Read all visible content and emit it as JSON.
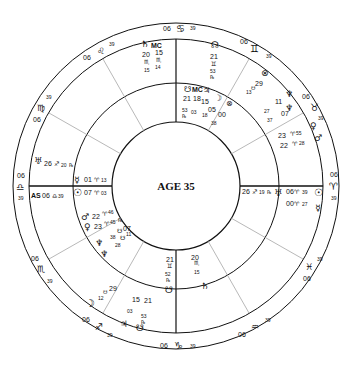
{
  "center_label": "AGE 35",
  "signs": [
    {
      "glyph": "♋",
      "deg": "06",
      "min": "39",
      "name": "cancer"
    },
    {
      "glyph": "♊",
      "deg": "06",
      "min": "39",
      "name": "gemini"
    },
    {
      "glyph": "♉",
      "deg": "06",
      "min": "39",
      "name": "taurus"
    },
    {
      "glyph": "♈",
      "deg": "06",
      "min": "39",
      "name": "aries"
    },
    {
      "glyph": "♓",
      "deg": "06",
      "min": "39",
      "name": "pisces"
    },
    {
      "glyph": "♒",
      "deg": "06",
      "min": "39",
      "name": "aquarius"
    },
    {
      "glyph": "♑",
      "deg": "06",
      "min": "39",
      "name": "capricorn"
    },
    {
      "glyph": "♐",
      "deg": "06",
      "min": "39",
      "name": "sagittarius"
    },
    {
      "glyph": "♏",
      "deg": "06",
      "min": "39",
      "name": "scorpio"
    },
    {
      "glyph": "♎",
      "deg": "06",
      "min": "39",
      "name": "libra"
    },
    {
      "glyph": "♍",
      "deg": "06",
      "min": "39",
      "name": "virgo"
    },
    {
      "glyph": "♌",
      "deg": "06",
      "min": "39",
      "name": "leo"
    }
  ],
  "outer_planets": {
    "saturn_mc": {
      "g1": "♄",
      "g2": "MC",
      "d1": "20",
      "s1": "♏",
      "m1": "15",
      "d2": "15",
      "s2": "♏",
      "m2": "14"
    },
    "node_top": {
      "g": "☊",
      "d": "21",
      "s": "♊",
      "m": "53",
      "r": "℞"
    },
    "node_bottom": {
      "g": "☋",
      "d": "21",
      "s": "♊",
      "m": "52",
      "r": "℞"
    },
    "saturn_bottom": {
      "g": "♄",
      "d": "20",
      "s": "♏",
      "m": "15"
    },
    "uranus_left": {
      "g": "♅",
      "d": "26",
      "s": "♐",
      "m": "20",
      "r": "℞"
    },
    "as": {
      "g": "AS",
      "d": "06",
      "s": "♎",
      "m": "39"
    },
    "mercury_left": {
      "g": "☿",
      "d": "01",
      "s": "♈",
      "m": "13"
    },
    "sun_left": {
      "g": "☉",
      "d": "07",
      "s": "♈",
      "m": "03"
    },
    "mars_left": {
      "g": "♂",
      "d": "22",
      "s": "♈",
      "m": "46"
    },
    "venus_left": {
      "g": "♀",
      "d": "23",
      "s": "♈",
      "m": "45",
      "r": "℞"
    },
    "pluto_left": {
      "a": "07",
      "b": "11",
      "c": "38",
      "d": "28"
    },
    "neptune_left": {
      "g1": "♆",
      "g2": "♆"
    },
    "point_29_left": {
      "d": "29",
      "s": "♉",
      "m": "12"
    },
    "moon_left": {
      "g": "☽"
    },
    "jup_left": {
      "g": "♃",
      "g2": "☋",
      "d1": "15",
      "m1": "03",
      "d2": "21",
      "m2": "53",
      "r": "℞"
    },
    "uranus_right": {
      "g": "♅",
      "d": "26",
      "s": "♐",
      "m": "19",
      "r": "℞"
    },
    "sun_right": {
      "g": "☉",
      "d": "06",
      "s": "♈",
      "m": "39"
    },
    "mercury_right": {
      "g": "☿",
      "d": "00",
      "s": "♈",
      "m": "27"
    },
    "mars_right": {
      "g": "♂",
      "d": "22",
      "s": "♈",
      "m": "28"
    },
    "venus_right": {
      "g": "♀",
      "d": "23",
      "s": "♈",
      "m": "55",
      "r": "℞"
    },
    "neptune_right": {
      "g": "♆",
      "a": "27",
      "b": "11",
      "c": "37",
      "d": "07"
    },
    "pof_right": {
      "g": "⊗",
      "d": "29",
      "m": "13"
    },
    "top_cluster": {
      "g1": "☋",
      "g2": "MC",
      "g3": "♃",
      "g4": "☽",
      "g5": "⊗",
      "d1": "21",
      "d2": "18",
      "d3": "15",
      "d4": "05",
      "d5": "00",
      "m1": "53",
      "m2": "03",
      "m3": "18",
      "m4": "38",
      "r": "℞"
    }
  }
}
